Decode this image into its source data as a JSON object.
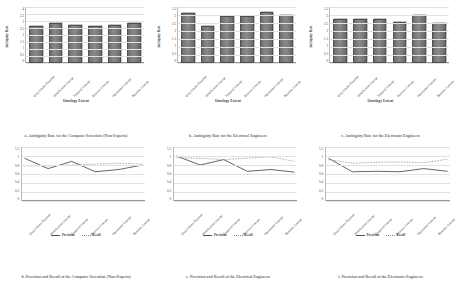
{
  "figure": {
    "categories": [
      "Query's Basic Elements",
      "Identification Concept",
      "Temporal Concept",
      "Resource Concept",
      "Operational Concept",
      "Modality Concept"
    ],
    "bar_ylabel": "Ambiguity Rate",
    "bar_xlabel": "Ontology Extent",
    "line_xlabel": "Ontology Extent",
    "bar_yticks": [
      "4",
      "3.5",
      "3",
      "2.5",
      "2",
      "1.5",
      "1",
      "0.5",
      "0"
    ],
    "line_yticks": [
      "1.2",
      "1",
      "0.8",
      "0.6",
      "0.4",
      "0.2",
      "0"
    ],
    "legend": {
      "precision": "Precision",
      "recall": "Recall"
    },
    "colors": {
      "bar": "#7a7a7a",
      "precision": "#555555",
      "recall": "#9a9a9a",
      "grid": "#e2e2e2"
    }
  },
  "captions": {
    "a": "a. Ambiguity Rate for the Computer Scientists (Non-Experts)",
    "b": "b. Ambiguity Rate for the Electrical Engineers",
    "c": "c. Ambiguity Rate for the Electronic Engineers",
    "d": "d. Precision and Recall of the Computer Scientists (Non-Experts)",
    "e": "e. Precision and Recall of the Electrical Engineers",
    "f": "f. Precision and Recall of the Electronic Engineers"
  },
  "chart_data": [
    {
      "id": "a",
      "type": "bar",
      "title": "a. Ambiguity Rate for the Computer Scientists (Non-Experts)",
      "xlabel": "Ontology Extent",
      "ylabel": "Ambiguity Rate",
      "ylim": [
        0,
        4
      ],
      "yticks": [
        0,
        0.5,
        1,
        1.5,
        2,
        2.5,
        3,
        3.5,
        4
      ],
      "grid": true,
      "categories": [
        "Query's Basic Elements",
        "Identification Concept",
        "Temporal Concept",
        "Resource Concept",
        "Operational Concept",
        "Modality Concept"
      ],
      "values": [
        2.5,
        2.7,
        2.6,
        2.5,
        2.6,
        2.7
      ]
    },
    {
      "id": "b",
      "type": "bar",
      "title": "b. Ambiguity Rate for the Electrical Engineers",
      "xlabel": "Ontology Extent",
      "ylabel": "Ambiguity Rate",
      "ylim": [
        0,
        3.5
      ],
      "yticks": [
        0,
        0.5,
        1,
        1.5,
        2,
        2.5,
        3,
        3.5
      ],
      "grid": true,
      "categories": [
        "Query's Basic Elements",
        "Identification Concept",
        "Temporal Concept",
        "Resource Concept",
        "Operational Concept",
        "Modality Concept"
      ],
      "values": [
        3.0,
        2.2,
        2.8,
        2.8,
        3.05,
        2.9
      ]
    },
    {
      "id": "c",
      "type": "bar",
      "title": "c. Ambiguity Rate for the Electronic Engineers",
      "xlabel": "Ontology Extent",
      "ylabel": "Ambiguity Rate",
      "ylim": [
        0,
        3.5
      ],
      "yticks": [
        0,
        0.5,
        1,
        1.5,
        2,
        2.5,
        3,
        3.5
      ],
      "grid": true,
      "categories": [
        "Query's Basic Elements",
        "Identification Concept",
        "Temporal Concept",
        "Resource Concept",
        "Operational Concept",
        "Modality Concept"
      ],
      "values": [
        2.6,
        2.6,
        2.6,
        2.45,
        2.9,
        2.4
      ]
    },
    {
      "id": "d",
      "type": "line",
      "title": "d. Precision and Recall of the Computer Scientists (Non-Experts)",
      "xlabel": "Ontology Extent",
      "ylabel": "",
      "ylim": [
        0,
        1.2
      ],
      "yticks": [
        0,
        0.2,
        0.4,
        0.6,
        0.8,
        1,
        1.2
      ],
      "grid": true,
      "legend_position": "bottom",
      "categories": [
        "Query's Basic Elements",
        "Identification Concept",
        "Temporal Concept",
        "Resource Concept",
        "Operational Concept",
        "Modality Concept"
      ],
      "series": [
        {
          "name": "Precision",
          "values": [
            0.95,
            0.72,
            0.88,
            0.65,
            0.7,
            0.8
          ]
        },
        {
          "name": "Recall",
          "values": [
            0.78,
            0.78,
            0.8,
            0.82,
            0.84,
            0.82
          ]
        }
      ]
    },
    {
      "id": "e",
      "type": "line",
      "title": "e. Precision and Recall of the Electrical Engineers",
      "xlabel": "Ontology Extent",
      "ylabel": "",
      "ylim": [
        0,
        1.2
      ],
      "yticks": [
        0,
        0.2,
        0.4,
        0.6,
        0.8,
        1,
        1.2
      ],
      "grid": true,
      "legend_position": "bottom",
      "categories": [
        "Query's Basic Elements",
        "Identification Concept",
        "Temporal Concept",
        "Resource Concept",
        "Operational Concept",
        "Modality Concept"
      ],
      "series": [
        {
          "name": "Precision",
          "values": [
            1.0,
            0.8,
            0.92,
            0.66,
            0.7,
            0.64
          ]
        },
        {
          "name": "Recall",
          "values": [
            0.96,
            0.95,
            0.92,
            0.95,
            0.98,
            0.88
          ]
        }
      ]
    },
    {
      "id": "f",
      "type": "line",
      "title": "f. Precision and Recall of the Electronic Engineers",
      "xlabel": "Ontology Extent",
      "ylabel": "",
      "ylim": [
        0,
        1.2
      ],
      "yticks": [
        0,
        0.2,
        0.4,
        0.6,
        0.8,
        1,
        1.2
      ],
      "grid": true,
      "legend_position": "bottom",
      "categories": [
        "Query's Basic Elements",
        "Identification Concept",
        "Temporal Concept",
        "Resource Concept",
        "Operational Concept",
        "Modality Concept"
      ],
      "series": [
        {
          "name": "Precision",
          "values": [
            0.95,
            0.65,
            0.66,
            0.65,
            0.72,
            0.66
          ]
        },
        {
          "name": "Recall",
          "values": [
            0.92,
            0.84,
            0.86,
            0.87,
            0.85,
            0.93
          ]
        }
      ]
    }
  ]
}
